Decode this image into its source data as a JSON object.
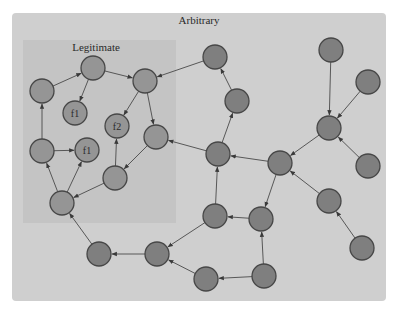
{
  "regions": {
    "outer": {
      "label": "Arbitrary",
      "x": 12,
      "y": 13,
      "w": 374,
      "h": 288,
      "fill": "#cfcfcf",
      "label_x": 199,
      "label_y": 24
    },
    "inner": {
      "label": "Legitimate",
      "x": 23,
      "y": 40,
      "w": 153,
      "h": 183,
      "fill": "#c4c4c4",
      "label_x": 96,
      "label_y": 51
    }
  },
  "style": {
    "node_radius": 12,
    "outer_node_fill": "#7f7f7f",
    "inner_node_fill": "#959595",
    "node_stroke": "#474747",
    "edge_color": "#4a4a4a"
  },
  "nodes": [
    {
      "id": "A",
      "x": 42,
      "y": 91,
      "type": "inner",
      "label": ""
    },
    {
      "id": "B",
      "x": 93,
      "y": 68,
      "type": "inner",
      "label": ""
    },
    {
      "id": "C",
      "x": 145,
      "y": 81,
      "type": "inner",
      "label": ""
    },
    {
      "id": "f1a",
      "x": 75,
      "y": 113,
      "type": "inner",
      "label": "f1"
    },
    {
      "id": "f2",
      "x": 117,
      "y": 126,
      "type": "inner",
      "label": "f2"
    },
    {
      "id": "D",
      "x": 156,
      "y": 137,
      "type": "inner",
      "label": ""
    },
    {
      "id": "E",
      "x": 42,
      "y": 151,
      "type": "inner",
      "label": ""
    },
    {
      "id": "f1b",
      "x": 87,
      "y": 150,
      "type": "inner",
      "label": "f1"
    },
    {
      "id": "F",
      "x": 115,
      "y": 178,
      "type": "inner",
      "label": ""
    },
    {
      "id": "G",
      "x": 62,
      "y": 203,
      "type": "inner",
      "label": ""
    },
    {
      "id": "H",
      "x": 215,
      "y": 57,
      "type": "outer",
      "label": ""
    },
    {
      "id": "I",
      "x": 237,
      "y": 101,
      "type": "outer",
      "label": ""
    },
    {
      "id": "J",
      "x": 218,
      "y": 154,
      "type": "outer",
      "label": ""
    },
    {
      "id": "K",
      "x": 280,
      "y": 163,
      "type": "outer",
      "label": ""
    },
    {
      "id": "L",
      "x": 331,
      "y": 50,
      "type": "outer",
      "label": ""
    },
    {
      "id": "M",
      "x": 368,
      "y": 82,
      "type": "outer",
      "label": ""
    },
    {
      "id": "N",
      "x": 329,
      "y": 128,
      "type": "outer",
      "label": ""
    },
    {
      "id": "O",
      "x": 368,
      "y": 166,
      "type": "outer",
      "label": ""
    },
    {
      "id": "P",
      "x": 329,
      "y": 201,
      "type": "outer",
      "label": ""
    },
    {
      "id": "Q",
      "x": 362,
      "y": 248,
      "type": "outer",
      "label": ""
    },
    {
      "id": "R",
      "x": 215,
      "y": 216,
      "type": "outer",
      "label": ""
    },
    {
      "id": "S",
      "x": 261,
      "y": 219,
      "type": "outer",
      "label": ""
    },
    {
      "id": "T",
      "x": 157,
      "y": 254,
      "type": "outer",
      "label": ""
    },
    {
      "id": "U",
      "x": 99,
      "y": 254,
      "type": "outer",
      "label": ""
    },
    {
      "id": "V",
      "x": 206,
      "y": 279,
      "type": "outer",
      "label": ""
    },
    {
      "id": "W",
      "x": 264,
      "y": 276,
      "type": "outer",
      "label": ""
    }
  ],
  "edges": [
    {
      "from": "A",
      "to": "B"
    },
    {
      "from": "B",
      "to": "C"
    },
    {
      "from": "B",
      "to": "f1a"
    },
    {
      "from": "C",
      "to": "f2"
    },
    {
      "from": "C",
      "to": "D"
    },
    {
      "from": "E",
      "to": "A"
    },
    {
      "from": "E",
      "to": "f1b"
    },
    {
      "from": "G",
      "to": "E"
    },
    {
      "from": "G",
      "to": "f1b"
    },
    {
      "from": "F",
      "to": "f2"
    },
    {
      "from": "F",
      "to": "G"
    },
    {
      "from": "D",
      "to": "F"
    },
    {
      "from": "H",
      "to": "C"
    },
    {
      "from": "I",
      "to": "H"
    },
    {
      "from": "J",
      "to": "I"
    },
    {
      "from": "J",
      "to": "D"
    },
    {
      "from": "K",
      "to": "J"
    },
    {
      "from": "K",
      "to": "S"
    },
    {
      "from": "L",
      "to": "N"
    },
    {
      "from": "M",
      "to": "N"
    },
    {
      "from": "N",
      "to": "K"
    },
    {
      "from": "O",
      "to": "N"
    },
    {
      "from": "P",
      "to": "K"
    },
    {
      "from": "Q",
      "to": "P"
    },
    {
      "from": "R",
      "to": "J"
    },
    {
      "from": "S",
      "to": "R"
    },
    {
      "from": "R",
      "to": "T"
    },
    {
      "from": "T",
      "to": "U"
    },
    {
      "from": "U",
      "to": "G"
    },
    {
      "from": "V",
      "to": "T"
    },
    {
      "from": "W",
      "to": "V"
    },
    {
      "from": "W",
      "to": "S"
    }
  ]
}
